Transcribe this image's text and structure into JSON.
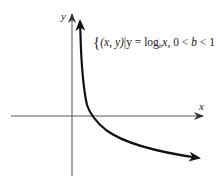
{
  "diagram": {
    "type": "function-graph",
    "axes": {
      "x_label": "x",
      "y_label": "y",
      "origin_px": [
        72,
        116
      ]
    },
    "curve": {
      "description": "logarithmic curve, decreasing, with base between 0 and 1",
      "passes_through": "(1, 0)",
      "asymptote": "y-axis (x = 0)",
      "color": "#111111"
    },
    "set_label": {
      "open_brace": "{",
      "pair": "(x, y)",
      "bar": "|",
      "eq_lhs": "y = log",
      "base": "b",
      "argument": "x",
      "condition": ", 0 < ",
      "cond_var": "b",
      "cond_rhs": " < 1",
      "close_brace": "}",
      "full_text": "{(x, y)|y = log_b x, 0 < b < 1}"
    }
  }
}
